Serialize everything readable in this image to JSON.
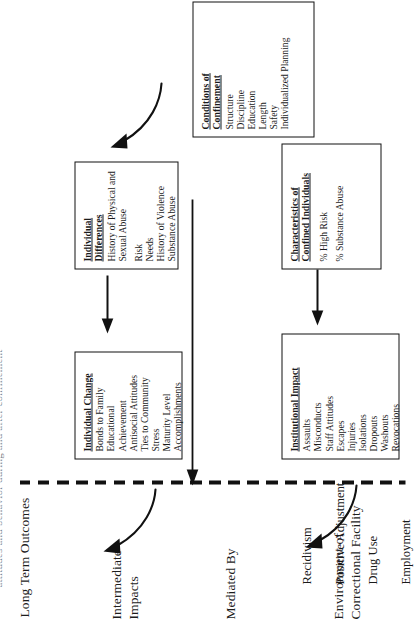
{
  "figure": {
    "caption_remnant": "attitudes and behavior during and after confinement",
    "orientation": "rotated-90-landscape"
  },
  "columns": [
    {
      "id": "environment",
      "label": "Environment of\nCorrectional Facility"
    },
    {
      "id": "mediated",
      "label": "Mediated By"
    },
    {
      "id": "intermediate",
      "label": "Intermediate\nImpacts"
    },
    {
      "id": "longterm",
      "label": "Long Term Outcomes"
    }
  ],
  "boxes": {
    "conditions": {
      "title": "Conditions of\nConfinement",
      "items": [
        "Structure",
        "Discipline",
        "Education",
        "Length",
        "Safety",
        "Individualized Planning"
      ]
    },
    "individual_differences": {
      "title": "Individual Differences",
      "items": [
        "History of Physical and",
        "    Sexual Abuse",
        "Risk",
        "Needs",
        "History of Violence",
        "Substance Abuse"
      ]
    },
    "characteristics": {
      "title": "Characteristics of\nConfined Individuals",
      "items": [
        "% High Risk",
        "% Substance Abuse"
      ]
    },
    "individual_change": {
      "title": "Individual Change",
      "items": [
        "Bonds to Family",
        "Educational Achievement",
        "Antisocial Attitudes",
        "Ties to Community",
        "Stress",
        "Maturity Level",
        "Accomplishments"
      ]
    },
    "institutional_impact": {
      "title": "Institutional Impact",
      "items": [
        "Assaults",
        "Misconducts",
        "Staff Attitudes",
        "Escapes",
        "Injuries",
        "Isolations",
        "Dropouts",
        "Washouts",
        "Revocations"
      ]
    }
  },
  "long_term_outcomes": {
    "items": [
      "Recidivism",
      "Positive Adjustment",
      "Drug Use",
      "Employment"
    ]
  },
  "colors": {
    "ink": "#111111",
    "paper": "#ffffff"
  }
}
